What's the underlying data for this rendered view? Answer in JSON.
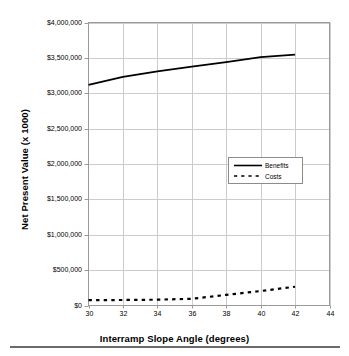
{
  "chart_data": {
    "type": "line",
    "title": "",
    "xlabel": "Interramp Slope Angle (degrees)",
    "ylabel": "Net Present Value (x 1000)",
    "xlim": [
      30,
      44
    ],
    "ylim": [
      0,
      4000000
    ],
    "xticks": [
      "30",
      "32",
      "34",
      "36",
      "38",
      "40",
      "42",
      "44"
    ],
    "xtick_values": [
      30,
      32,
      34,
      36,
      38,
      40,
      42,
      44
    ],
    "yticks": [
      "$0",
      "$500,000",
      "$1,000,000",
      "$1,500,000",
      "$2,000,000",
      "$2,500,000",
      "$3,000,000",
      "$3,500,000",
      "$4,000,000"
    ],
    "ytick_values": [
      0,
      500000,
      1000000,
      1500000,
      2000000,
      2500000,
      3000000,
      3500000,
      4000000
    ],
    "grid": true,
    "legend_position": "center-right",
    "x": [
      30,
      32,
      34,
      36,
      38,
      40,
      42
    ],
    "series": [
      {
        "name": "Benefits",
        "style": "solid",
        "color": "#000000",
        "values": [
          3120000,
          3230000,
          3310000,
          3375000,
          3440000,
          3510000,
          3545000
        ]
      },
      {
        "name": "Costs",
        "style": "dashed",
        "color": "#000000",
        "values": [
          75000,
          78000,
          82000,
          95000,
          150000,
          205000,
          265000
        ]
      }
    ]
  },
  "legend": {
    "items": [
      {
        "label": "Benefits"
      },
      {
        "label": "Costs"
      }
    ]
  },
  "colors": {
    "axis": "#999999",
    "grid": "#cccccc",
    "series": "#000000",
    "rule": "#6b6b6b"
  }
}
